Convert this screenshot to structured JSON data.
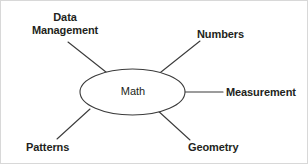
{
  "diagram": {
    "type": "concept-map",
    "title": "Math",
    "center": {
      "label": "Math",
      "shape": "ellipse",
      "cx": 131.5,
      "cy": 91,
      "rx": 52.5,
      "ry": 23,
      "stroke": "#3b3b3b",
      "fill": "#ffffff"
    },
    "text_color": "#231f20",
    "line_color": "#3b3b3b",
    "background": "#ffffff",
    "border_color": "#d8d8d8",
    "branches": [
      {
        "id": "data-management",
        "label": "Data\nManagement",
        "position": "upper-left",
        "line": {
          "x1": 110,
          "y1": 75,
          "x2": 67,
          "y2": 41
        }
      },
      {
        "id": "numbers",
        "label": "Numbers",
        "position": "upper-right",
        "line": {
          "x1": 155,
          "y1": 75,
          "x2": 199,
          "y2": 40
        }
      },
      {
        "id": "measurement",
        "label": "Measurement",
        "position": "right",
        "line": {
          "x1": 184,
          "y1": 91,
          "x2": 222,
          "y2": 91
        }
      },
      {
        "id": "patterns",
        "label": "Patterns",
        "position": "lower-left",
        "line": {
          "x1": 89,
          "y1": 108,
          "x2": 56,
          "y2": 138
        }
      },
      {
        "id": "geometry",
        "label": "Geometry",
        "position": "lower-right",
        "line": {
          "x1": 155,
          "y1": 108,
          "x2": 189,
          "y2": 139
        }
      }
    ]
  }
}
